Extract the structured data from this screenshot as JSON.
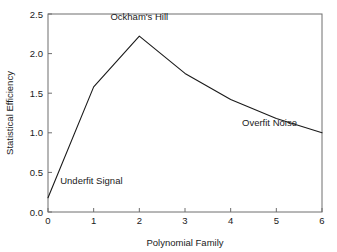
{
  "chart_data": {
    "type": "line",
    "title": "",
    "subtitle": "",
    "xlabel": "Polynomial Family",
    "ylabel": "Statistical Efficiency",
    "xlim": [
      0,
      6
    ],
    "ylim": [
      0,
      2.5
    ],
    "grid": false,
    "legend": "none",
    "x": [
      0,
      1,
      2,
      3,
      4,
      5,
      6
    ],
    "values": [
      0.18,
      1.58,
      2.22,
      1.75,
      1.42,
      1.18,
      1.0
    ],
    "series": [
      {
        "name": "Statistical Efficiency",
        "x": [
          0,
          1,
          2,
          3,
          4,
          5,
          6
        ],
        "values": [
          0.18,
          1.58,
          2.22,
          1.75,
          1.42,
          1.18,
          1.0
        ],
        "color": "#1a1a1a"
      }
    ],
    "xticks": [
      0,
      1,
      2,
      3,
      4,
      5,
      6
    ],
    "xtick_labels": [
      "0",
      "1",
      "2",
      "3",
      "4",
      "5",
      "6"
    ],
    "yticks": [
      0.0,
      0.5,
      1.0,
      1.5,
      2.0,
      2.5
    ],
    "ytick_labels": [
      "0.0",
      "0.5",
      "1.0",
      "1.5",
      "2.0",
      "2.5"
    ],
    "annotations": [
      {
        "text": "Ockham's Hill",
        "x": 2.0,
        "y": 2.42,
        "anchor": "middle"
      },
      {
        "text": "Underfit Signal",
        "x": 0.95,
        "y": 0.35,
        "anchor": "middle"
      },
      {
        "text": "Overfit Noise",
        "x": 4.85,
        "y": 1.08,
        "anchor": "middle"
      }
    ],
    "colors": {
      "line": "#1a1a1a",
      "frame": "#6e6e6e",
      "text": "#1a1a1a",
      "background": "#ffffff"
    }
  },
  "axes": {
    "x_title": "Polynomial Family",
    "y_title": "Statistical Efficiency"
  }
}
